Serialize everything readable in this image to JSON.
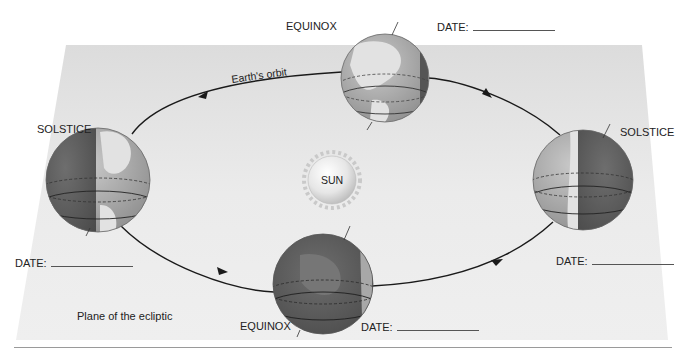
{
  "diagram": {
    "plane_label": "Plane of the ecliptic",
    "orbit_label": "Earth's orbit",
    "sun_label": "SUN",
    "positions": [
      {
        "id": "top",
        "event": "EQUINOX",
        "date_label": "DATE:",
        "date_value": ""
      },
      {
        "id": "left",
        "event": "SOLSTICE",
        "date_label": "DATE:",
        "date_value": ""
      },
      {
        "id": "right",
        "event": "SOLSTICE",
        "date_label": "DATE:",
        "date_value": ""
      },
      {
        "id": "bottom",
        "event": "EQUINOX",
        "date_label": "DATE:",
        "date_value": ""
      }
    ],
    "orbit_direction": "counterclockwise",
    "colors": {
      "plane": "#e9e9e9",
      "globe_light": "#b8b8b8",
      "globe_dark": "#5f5f5f",
      "land_light": "#e4e4e4",
      "sun": "#ececec",
      "orbit": "#1a1a1a",
      "rule": "#9a9a9a"
    }
  }
}
